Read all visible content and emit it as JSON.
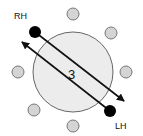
{
  "diagram": {
    "labels": {
      "rh": "RH",
      "lh": "LH",
      "count": "3"
    },
    "colors": {
      "small_circle_fill": "#d4d4d4",
      "small_circle_stroke": "#777777",
      "big_circle_fill": "#ececec",
      "big_circle_stroke": "#666666",
      "dot": "#000000",
      "line": "#111111"
    },
    "positions": [
      {
        "name": "top",
        "cx": 73,
        "cy": 14
      },
      {
        "name": "upper-right",
        "cx": 111,
        "cy": 33
      },
      {
        "name": "right",
        "cx": 126,
        "cy": 72
      },
      {
        "name": "bottom",
        "cx": 73,
        "cy": 126
      },
      {
        "name": "lower-left",
        "cx": 34,
        "cy": 110
      },
      {
        "name": "left",
        "cx": 18,
        "cy": 72
      }
    ]
  }
}
